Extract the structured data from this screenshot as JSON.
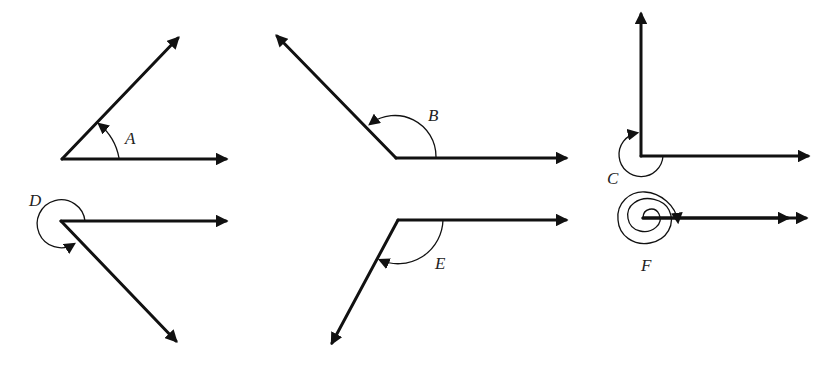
{
  "diagram": {
    "type": "angle-rotations",
    "colors": {
      "stroke": "#111111",
      "background": "#ffffff"
    },
    "angles": [
      {
        "id": "A",
        "label": "A",
        "description": "acute angle, counterclockwise rotation from horizontal ray",
        "approx_degrees": 45
      },
      {
        "id": "B",
        "label": "B",
        "description": "obtuse angle, counterclockwise rotation",
        "approx_degrees": 135
      },
      {
        "id": "C",
        "label": "C",
        "description": "reflex rotation, clockwise to vertical ray",
        "approx_degrees": -270
      },
      {
        "id": "D",
        "label": "D",
        "description": "reflex rotation, counterclockwise past full sweep",
        "approx_degrees": 315
      },
      {
        "id": "E",
        "label": "E",
        "description": "negative (clockwise) rotation",
        "approx_degrees": -120
      },
      {
        "id": "F",
        "label": "F",
        "description": "multiple full rotations (spiral), terminal ray coincides with initial ray",
        "approx_degrees": 720
      }
    ]
  }
}
